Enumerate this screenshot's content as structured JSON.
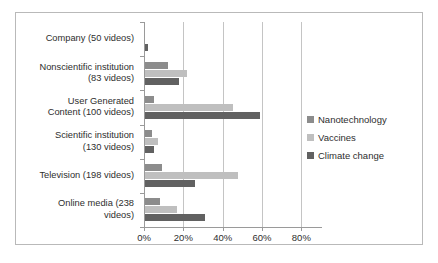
{
  "chart_data": {
    "type": "bar",
    "orientation": "horizontal",
    "title": "",
    "subtitle": "",
    "xlabel": "",
    "ylabel": "",
    "xlim": [
      0,
      90
    ],
    "grid": true,
    "legend_position": "right",
    "xticks": [
      "0%",
      "20%",
      "40%",
      "60%",
      "80%"
    ],
    "xtick_values": [
      0,
      20,
      40,
      60,
      80
    ],
    "categories": [
      "Company (50 videos)",
      "Nonscientific institution (83 videos)",
      "User Generated Content (100 videos)",
      "Scientific institution (130 videos)",
      "Television (198 videos)",
      "Online media (238 videos)"
    ],
    "category_lines": [
      [
        "Company (50 videos)"
      ],
      [
        "Nonscientific institution",
        "(83 videos)"
      ],
      [
        "User Generated",
        "Content (100 videos)"
      ],
      [
        "Scientific institution",
        "(130 videos)"
      ],
      [
        "Television (198 videos)"
      ],
      [
        "Online media (238",
        "videos)"
      ]
    ],
    "series": [
      {
        "name": "Nanotechnology",
        "color": "#8c8c8c",
        "values": [
          0,
          12,
          5,
          4,
          9,
          8
        ]
      },
      {
        "name": "Vaccines",
        "color": "#bfbfbf",
        "values": [
          0,
          22,
          45,
          7,
          48,
          17
        ]
      },
      {
        "name": "Climate change",
        "color": "#616161",
        "values": [
          2,
          18,
          59,
          5,
          26,
          31
        ]
      }
    ]
  },
  "legend": {
    "items": [
      {
        "label": "Nanotechnology",
        "color": "#8c8c8c"
      },
      {
        "label": "Vaccines",
        "color": "#bfbfbf"
      },
      {
        "label": "Climate change",
        "color": "#616161"
      }
    ]
  },
  "colors": {
    "nanotechnology": "#8c8c8c",
    "vaccines": "#bfbfbf",
    "climate_change": "#616161",
    "gridline": "#c4c4c4",
    "axis": "#9a9a9a",
    "border": "#b9b9b9",
    "text": "#2e2e2e",
    "background": "#ffffff"
  }
}
